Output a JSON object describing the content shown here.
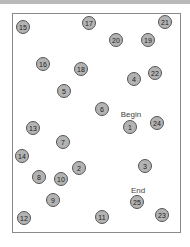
{
  "labels": {
    "begin": {
      "text": "Begin",
      "x": 131,
      "y": 114
    },
    "end": {
      "text": "End",
      "x": 138,
      "y": 190
    }
  },
  "nodes": [
    {
      "n": "1",
      "x": 130,
      "y": 127
    },
    {
      "n": "2",
      "x": 79,
      "y": 168
    },
    {
      "n": "3",
      "x": 145,
      "y": 166
    },
    {
      "n": "4",
      "x": 134,
      "y": 79
    },
    {
      "n": "5",
      "x": 64,
      "y": 91
    },
    {
      "n": "6",
      "x": 102,
      "y": 109
    },
    {
      "n": "7",
      "x": 63,
      "y": 142
    },
    {
      "n": "8",
      "x": 39,
      "y": 177
    },
    {
      "n": "9",
      "x": 53,
      "y": 200
    },
    {
      "n": "10",
      "x": 61,
      "y": 179
    },
    {
      "n": "11",
      "x": 102,
      "y": 217
    },
    {
      "n": "12",
      "x": 24,
      "y": 218
    },
    {
      "n": "13",
      "x": 33,
      "y": 128
    },
    {
      "n": "14",
      "x": 22,
      "y": 156
    },
    {
      "n": "15",
      "x": 23,
      "y": 27
    },
    {
      "n": "16",
      "x": 43,
      "y": 64
    },
    {
      "n": "17",
      "x": 89,
      "y": 23
    },
    {
      "n": "18",
      "x": 81,
      "y": 69
    },
    {
      "n": "19",
      "x": 148,
      "y": 40
    },
    {
      "n": "20",
      "x": 116,
      "y": 40
    },
    {
      "n": "21",
      "x": 165,
      "y": 22
    },
    {
      "n": "22",
      "x": 155,
      "y": 73
    },
    {
      "n": "23",
      "x": 162,
      "y": 215
    },
    {
      "n": "24",
      "x": 157,
      "y": 123
    },
    {
      "n": "25",
      "x": 137,
      "y": 202
    }
  ]
}
